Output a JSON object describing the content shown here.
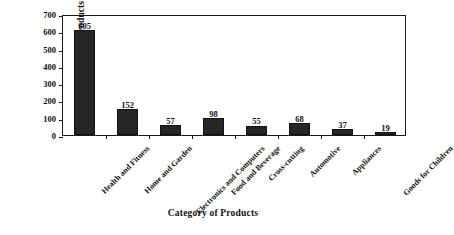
{
  "chart_data": {
    "type": "bar",
    "title": "",
    "xlabel": "Category of Products",
    "ylabel": "Number of Products",
    "categories": [
      "Health and Fitness",
      "Home and Garden",
      "Electronics and Computers",
      "Food and Beverage",
      "Cross-cutting",
      "Automotive",
      "Appliances",
      "Goods for Children"
    ],
    "values": [
      605,
      152,
      57,
      98,
      55,
      68,
      37,
      19
    ],
    "value_labels": [
      "605",
      "152",
      "57",
      "98",
      "55",
      "68",
      "37",
      "19"
    ],
    "ylim": [
      0,
      700
    ],
    "ytick_values": [
      0,
      100,
      200,
      300,
      400,
      500,
      600,
      700
    ],
    "ytick_labels": [
      "0",
      "100",
      "200",
      "300",
      "400",
      "500",
      "600",
      "700"
    ],
    "grid": false,
    "legend": null,
    "bar_color": "#262626",
    "axis_color": "#1a1a1a",
    "background_color": "#ffffff"
  }
}
